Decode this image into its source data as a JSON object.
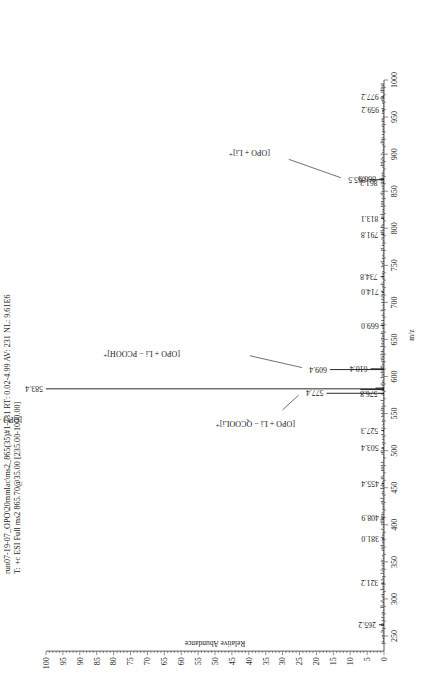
{
  "header": {
    "line1": "run07-19-07_OPO\\20mmlac\\ms2_865(35)#1-231 RT: 0.02-4.99 AV: 231 NL: 9.61E6",
    "line2": "T: +c ESI Full ms2 865.70@35.00 [235.00-1000.00]"
  },
  "chart_data": {
    "type": "bar",
    "subtype": "mass-spectrum (stick plot), image rotated 90° counter-clockwise",
    "title": "run07-19-07_OPO\\20mmlac\\ms2_865(35)#1-231 RT: 0.02-4.99 AV: 231 NL: 9.61E6",
    "subtitle": "T: +c ESI Full ms2 865.70@35.00 [235.00-1000.00]",
    "xlabel": "m/z",
    "ylabel": "Relative Abundance",
    "xlim": [
      235,
      1000
    ],
    "ylim": [
      0,
      100
    ],
    "xticks": [
      250,
      300,
      350,
      400,
      450,
      500,
      550,
      600,
      650,
      700,
      750,
      800,
      850,
      900,
      950,
      1000
    ],
    "yticks": [
      0,
      5,
      10,
      15,
      20,
      25,
      30,
      35,
      40,
      45,
      50,
      55,
      60,
      65,
      70,
      75,
      80,
      85,
      90,
      95,
      100
    ],
    "grid": false,
    "peaks": [
      {
        "mz": 265.2,
        "abundance": 1.5,
        "label": "265.2"
      },
      {
        "mz": 321.2,
        "abundance": 0.8,
        "label": "321.2"
      },
      {
        "mz": 381.0,
        "abundance": 0.6,
        "label": "381.0"
      },
      {
        "mz": 408.9,
        "abundance": 0.6,
        "label": "408.9"
      },
      {
        "mz": 455.4,
        "abundance": 0.6,
        "label": "455.4"
      },
      {
        "mz": 503.4,
        "abundance": 0.7,
        "label": "503.4"
      },
      {
        "mz": 527.3,
        "abundance": 0.8,
        "label": "527.3"
      },
      {
        "mz": 576.8,
        "abundance": 1.0,
        "label": "576.8"
      },
      {
        "mz": 577.4,
        "abundance": 17.0,
        "label": "577.4"
      },
      {
        "mz": 582.4,
        "abundance": 7.0,
        "label": ""
      },
      {
        "mz": 583.4,
        "abundance": 100.0,
        "label": "583.4"
      },
      {
        "mz": 584.4,
        "abundance": 2.5,
        "label": ""
      },
      {
        "mz": 609.4,
        "abundance": 16.0,
        "label": "609.4"
      },
      {
        "mz": 610.4,
        "abundance": 4.0,
        "label": "610.4"
      },
      {
        "mz": 669.0,
        "abundance": 0.7,
        "label": "669.0"
      },
      {
        "mz": 714.0,
        "abundance": 0.7,
        "label": "714.0"
      },
      {
        "mz": 734.8,
        "abundance": 1.0,
        "label": "734.8"
      },
      {
        "mz": 791.8,
        "abundance": 0.8,
        "label": "791.8"
      },
      {
        "mz": 813.1,
        "abundance": 0.8,
        "label": "813.1"
      },
      {
        "mz": 861.2,
        "abundance": 1.0,
        "label": "861.2"
      },
      {
        "mz": 865.5,
        "abundance": 4.5,
        "label": "865.5"
      },
      {
        "mz": 866.3,
        "abundance": 1.5,
        "label": "866.3"
      },
      {
        "mz": 959.2,
        "abundance": 0.6,
        "label": "959.2"
      },
      {
        "mz": 977.2,
        "abundance": 0.7,
        "label": "977.2"
      }
    ],
    "annotations": [
      {
        "text": "[OPO + Li − QCOOH]⁺",
        "peak_mz": 583.4
      },
      {
        "text": "[OPO + Li − QCOOLi]⁺",
        "peak_mz": 577.4
      },
      {
        "text": "[OPO + Li − PCOOH]⁺",
        "peak_mz": 609.4
      },
      {
        "text": "[OPO + Li]⁺",
        "peak_mz": 865.5
      }
    ]
  }
}
